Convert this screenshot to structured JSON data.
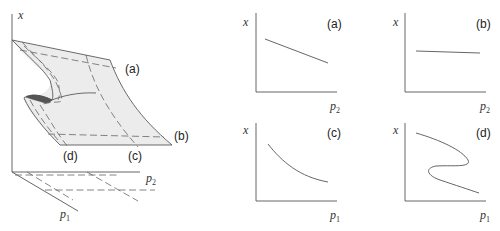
{
  "surface": {
    "axis_x_label": "x",
    "axis_p2_label": "p",
    "axis_p2_sub": "2",
    "axis_p1_label": "p",
    "axis_p1_sub": "1",
    "slice_labels": [
      "(a)",
      "(b)",
      "(c)",
      "(d)"
    ],
    "colors": {
      "surface_fill": "#ececec",
      "fold_shade": "#555555",
      "line": "#555555"
    }
  },
  "panels": [
    {
      "id": "a",
      "label": "(a)",
      "ylabel": "x",
      "xlabel": "p",
      "xlabel_sub": "2",
      "shape": "decreasing line"
    },
    {
      "id": "b",
      "label": "(b)",
      "ylabel": "x",
      "xlabel": "p",
      "xlabel_sub": "2",
      "shape": "nearly flat line"
    },
    {
      "id": "c",
      "label": "(c)",
      "ylabel": "x",
      "xlabel": "p",
      "xlabel_sub": "1",
      "shape": "decreasing convex curve"
    },
    {
      "id": "d",
      "label": "(d)",
      "ylabel": "x",
      "xlabel": "p",
      "xlabel_sub": "1",
      "shape": "S-shaped fold (hysteresis)"
    }
  ]
}
